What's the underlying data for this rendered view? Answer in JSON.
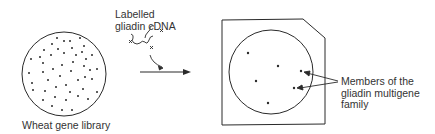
{
  "diagram": {
    "labels": {
      "library": "Wheat gene library",
      "probe_line1": "Labelled",
      "probe_line2": "gliadin cDNA",
      "members_line1": "Members of the",
      "members_line2": "gliadin multigene",
      "members_line3": "family"
    },
    "library_colonies": 48,
    "hybridised_spots": 6,
    "colors": {
      "ink": "#2a2a2a",
      "background": "#ffffff"
    }
  }
}
